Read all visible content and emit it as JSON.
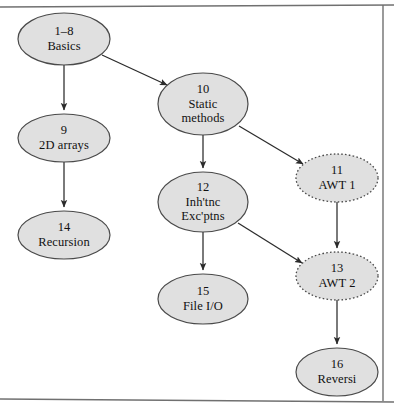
{
  "figure": {
    "kind": "directed-graph",
    "frame": {
      "style": "thin rule top, right and bottom",
      "color": "#6e6e6e"
    },
    "node_style": {
      "shape": "ellipse",
      "fill": "#e0e0e0",
      "stroke": "#4a4a4a",
      "solid_border": "solid",
      "optional_border": "dashed"
    },
    "edge_style": {
      "color": "#2b2b2b",
      "arrowhead": "filled-triangle"
    }
  },
  "nodes": [
    {
      "id": "n1",
      "number": "1–8",
      "title": "Basics",
      "border": "solid",
      "cx": 64,
      "cy": 39,
      "rx": 46,
      "ry": 26
    },
    {
      "id": "n9",
      "number": "9",
      "title": "2D arrays",
      "border": "solid",
      "cx": 64,
      "cy": 138,
      "rx": 46,
      "ry": 24
    },
    {
      "id": "n14",
      "number": "14",
      "title": "Recursion",
      "border": "solid",
      "cx": 64,
      "cy": 235,
      "rx": 46,
      "ry": 24
    },
    {
      "id": "n10",
      "number": "10",
      "title": "Static\nmethods",
      "title_lines": [
        "Static",
        "methods"
      ],
      "border": "solid",
      "cx": 203,
      "cy": 104,
      "rx": 45,
      "ry": 31
    },
    {
      "id": "n12",
      "number": "12",
      "title": "Inh'tnc\nExc'ptns",
      "title_lines": [
        "Inh'tnc",
        "Exc'ptns"
      ],
      "border": "solid",
      "cx": 203,
      "cy": 202,
      "rx": 45,
      "ry": 30
    },
    {
      "id": "n15",
      "number": "15",
      "title": "File I/O",
      "border": "solid",
      "cx": 203,
      "cy": 299,
      "rx": 45,
      "ry": 25
    },
    {
      "id": "n11",
      "number": "11",
      "title": "AWT 1",
      "border": "dashed",
      "cx": 337,
      "cy": 178,
      "rx": 41,
      "ry": 24
    },
    {
      "id": "n13",
      "number": "13",
      "title": "AWT 2",
      "border": "dashed",
      "cx": 337,
      "cy": 276,
      "rx": 41,
      "ry": 24
    },
    {
      "id": "n16",
      "number": "16",
      "title": "Reversi",
      "border": "solid",
      "cx": 337,
      "cy": 372,
      "rx": 41,
      "ry": 24
    }
  ],
  "edges": [
    {
      "id": "e1",
      "from": "n1",
      "to": "n9",
      "label": ""
    },
    {
      "id": "e2",
      "from": "n1",
      "to": "n10",
      "label": ""
    },
    {
      "id": "e3",
      "from": "n9",
      "to": "n14",
      "label": ""
    },
    {
      "id": "e4",
      "from": "n10",
      "to": "n12",
      "label": ""
    },
    {
      "id": "e5",
      "from": "n10",
      "to": "n11",
      "label": ""
    },
    {
      "id": "e6",
      "from": "n12",
      "to": "n15",
      "label": ""
    },
    {
      "id": "e7",
      "from": "n12",
      "to": "n13",
      "label": ""
    },
    {
      "id": "e8",
      "from": "n11",
      "to": "n13",
      "label": ""
    },
    {
      "id": "e9",
      "from": "n13",
      "to": "n16",
      "label": ""
    }
  ]
}
